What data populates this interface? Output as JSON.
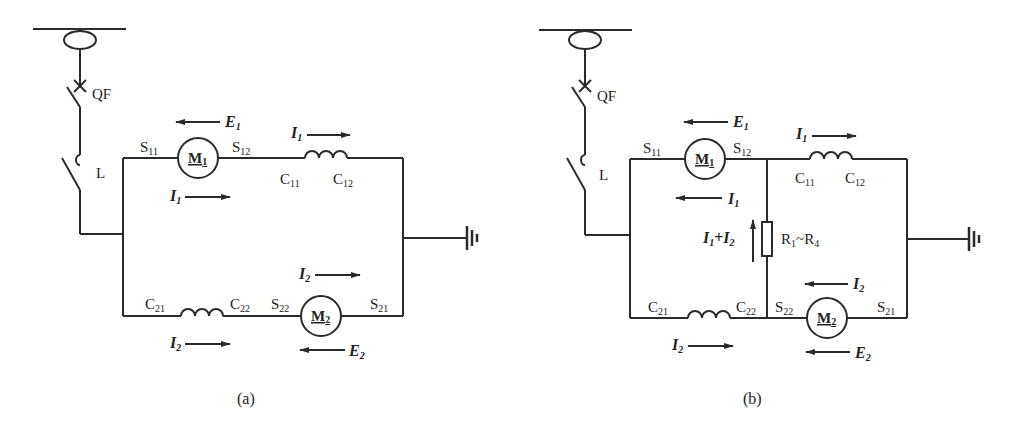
{
  "figure": {
    "panels": [
      {
        "id": "a",
        "caption": "(a)",
        "labels": {
          "breaker": "QF",
          "switch": "L",
          "m1": {
            "text": "M",
            "sub": "1"
          },
          "m2": {
            "text": "M",
            "sub": "2"
          },
          "s11": {
            "text": "S",
            "sub": "11"
          },
          "s12": {
            "text": "S",
            "sub": "12"
          },
          "s21": {
            "text": "S",
            "sub": "21"
          },
          "s22": {
            "text": "S",
            "sub": "22"
          },
          "c11": {
            "text": "C",
            "sub": "11"
          },
          "c12": {
            "text": "C",
            "sub": "12"
          },
          "c21": {
            "text": "C",
            "sub": "21"
          },
          "c22": {
            "text": "C",
            "sub": "22"
          },
          "e1": {
            "text": "E",
            "sub": "1"
          },
          "e2": {
            "text": "E",
            "sub": "2"
          },
          "i1": {
            "text": "I",
            "sub": "1"
          },
          "i2": {
            "text": "I",
            "sub": "2"
          }
        }
      },
      {
        "id": "b",
        "caption": "(b)",
        "labels": {
          "breaker": "QF",
          "switch": "L",
          "m1": {
            "text": "M",
            "sub": "1"
          },
          "m2": {
            "text": "M",
            "sub": "2"
          },
          "s11": {
            "text": "S",
            "sub": "11"
          },
          "s12": {
            "text": "S",
            "sub": "12"
          },
          "s21": {
            "text": "S",
            "sub": "21"
          },
          "s22": {
            "text": "S",
            "sub": "22"
          },
          "c11": {
            "text": "C",
            "sub": "11"
          },
          "c12": {
            "text": "C",
            "sub": "12"
          },
          "c21": {
            "text": "C",
            "sub": "21"
          },
          "c22": {
            "text": "C",
            "sub": "22"
          },
          "e1": {
            "text": "E",
            "sub": "1"
          },
          "e2": {
            "text": "E",
            "sub": "2"
          },
          "i1": {
            "text": "I",
            "sub": "1"
          },
          "i2": {
            "text": "I",
            "sub": "2"
          },
          "i_sum": {
            "a": "I",
            "a_sub": "1",
            "plus": "+",
            "b": "I",
            "b_sub": "2"
          },
          "resistor": {
            "r1": "R",
            "r1_sub": "1",
            "tilde": "~",
            "r4": "R",
            "r4_sub": "4"
          }
        }
      }
    ]
  }
}
